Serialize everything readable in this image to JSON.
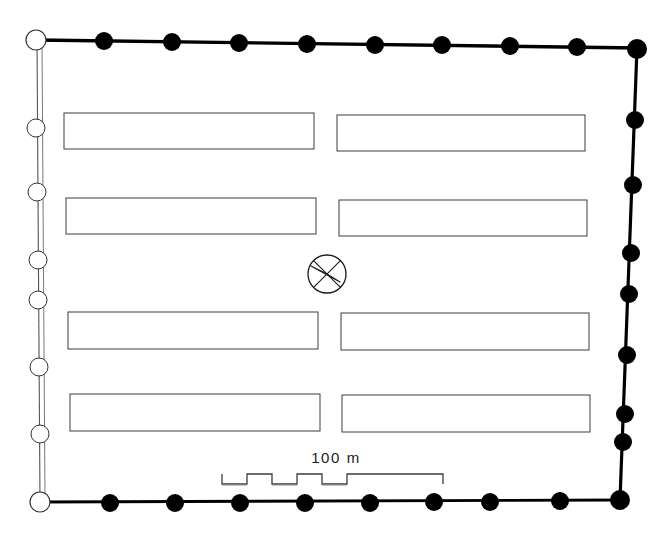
{
  "plan": {
    "title": "Archaeological site plan",
    "canvas": {
      "width": 666,
      "height": 546
    },
    "background_color": "#ffffff",
    "ink_color": "#000000",
    "thin_line_color": "#4a4a4a",
    "enclosure": {
      "name": "enclosure-wall",
      "corners": {
        "top_left": {
          "x": 37,
          "y": 40
        },
        "top_right": {
          "x": 637,
          "y": 48
        },
        "bottom_right": {
          "x": 620,
          "y": 500
        },
        "bottom_left": {
          "x": 40,
          "y": 502
        }
      },
      "walls": [
        {
          "id": "wall-top",
          "style": "thick-solid",
          "stroke_width": 3.2,
          "color": "#000000"
        },
        {
          "id": "wall-right",
          "style": "thick-solid",
          "stroke_width": 3.2,
          "color": "#000000"
        },
        {
          "id": "wall-bottom",
          "style": "thick-solid",
          "stroke_width": 2.6,
          "color": "#000000"
        },
        {
          "id": "wall-left",
          "style": "thin-double",
          "stroke_width": 1.0,
          "color": "#555555"
        }
      ]
    },
    "markers": {
      "filled": {
        "label": "filled-post-marker",
        "fill": "#000000",
        "stroke": "#000000",
        "radius": 9
      },
      "hollow": {
        "label": "hollow-post-marker",
        "fill": "#ffffff",
        "stroke": "#333333",
        "radius": 9
      },
      "top_edge_count": 8,
      "bottom_edge_count": 8,
      "left_edge_count": 6,
      "right_edge_count": 7,
      "corner_types": {
        "top_left": "hollow",
        "top_right": "filled",
        "bottom_right": "filled",
        "bottom_left": "hollow"
      }
    },
    "buildings": {
      "name": "building-blocks",
      "rows": 4,
      "columns": 2,
      "stroke": "#3d3d3d",
      "stroke_width": 1,
      "fill": "#ffffff",
      "items": [
        {
          "id": "block-r1-c1",
          "x": 64,
          "y": 113,
          "width": 250,
          "height": 36
        },
        {
          "id": "block-r1-c2",
          "x": 337,
          "y": 115,
          "width": 248,
          "height": 36
        },
        {
          "id": "block-r2-c1",
          "x": 66,
          "y": 198,
          "width": 250,
          "height": 36
        },
        {
          "id": "block-r2-c2",
          "x": 339,
          "y": 200,
          "width": 248,
          "height": 36
        },
        {
          "id": "block-r3-c1",
          "x": 68,
          "y": 312,
          "width": 250,
          "height": 37
        },
        {
          "id": "block-r3-c2",
          "x": 341,
          "y": 313,
          "width": 248,
          "height": 37
        },
        {
          "id": "block-r4-c1",
          "x": 70,
          "y": 394,
          "width": 250,
          "height": 37
        },
        {
          "id": "block-r4-c2",
          "x": 342,
          "y": 395,
          "width": 248,
          "height": 37
        }
      ]
    },
    "compass": {
      "name": "north-arrow-compass",
      "center_x": 327,
      "center_y": 274,
      "radius": 19,
      "stroke": "#1a1a1a",
      "stroke_width": 1.2,
      "north_direction_degrees": 315,
      "description": "circle with crossed axes and a narrow north arrow pointing upper-left"
    },
    "scale_bar": {
      "name": "scale-bar",
      "label": "100 m",
      "value": 100,
      "unit": "m",
      "label_x": 336,
      "label_y": 463,
      "bar_left": 222,
      "bar_right": 443,
      "bar_y": 480,
      "segment_count": 5,
      "stroke": "#3d3d3d",
      "stroke_width": 1.2
    }
  }
}
